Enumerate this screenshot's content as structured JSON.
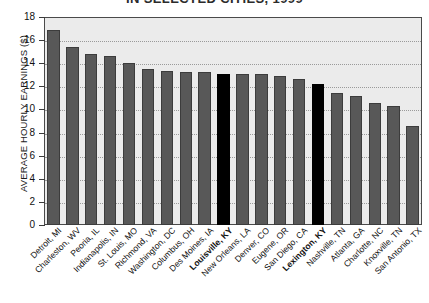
{
  "chart_data": {
    "type": "bar",
    "title": "IN SELECTED CITIES, 1999",
    "xlabel": "",
    "ylabel": "AVERAGE HOURLY EARNINGS ($)",
    "ylim": [
      0,
      18
    ],
    "yticks": [
      0,
      2,
      4,
      6,
      8,
      10,
      12,
      14,
      16,
      18
    ],
    "grid": true,
    "legend": "none",
    "categories": [
      "Detroit, MI",
      "Charleston, WV",
      "Peoria, IL",
      "Indianapolis, IN",
      "St. Louis, MO",
      "Richmond, VA",
      "Washington, DC",
      "Columbus, OH",
      "Des Moines, IA",
      "Louisville, KY",
      "New Orleans, LA",
      "Denver, CO",
      "Eugene, OR",
      "San Diego, CA",
      "Lexington, KY",
      "Nashville, TN",
      "Atlanta, GA",
      "Charlotte, NC",
      "Knoxville, TN",
      "San Antonio, TX"
    ],
    "values": [
      16.9,
      15.4,
      14.8,
      14.6,
      14.0,
      13.5,
      13.3,
      13.2,
      13.2,
      13.1,
      13.1,
      13.1,
      12.9,
      12.6,
      12.2,
      11.4,
      11.2,
      10.6,
      10.3,
      8.6
    ],
    "highlighted": [
      "Louisville, KY",
      "Lexington, KY"
    ],
    "colors": {
      "bar": "#585858",
      "bar_highlight": "#000000",
      "plot_background": "#ebebeb",
      "page_background": "#ffffff",
      "gridline": "#9a9a9a",
      "axis": "#3a3a3a",
      "text": "#111111"
    }
  }
}
